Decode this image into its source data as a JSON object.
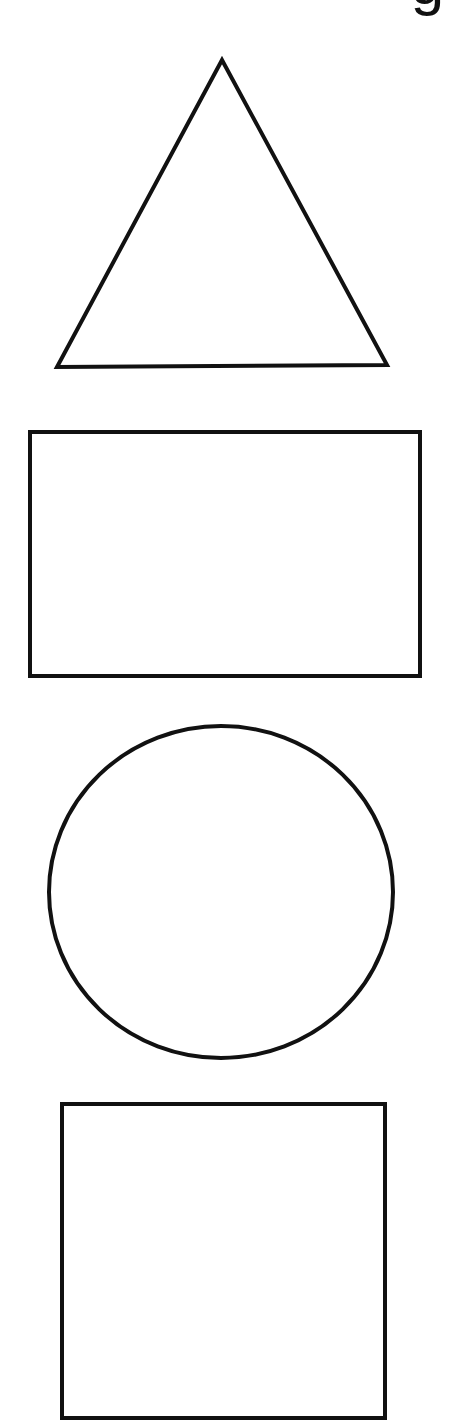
{
  "title": {
    "visible_fragment": "g"
  },
  "stroke": {
    "color": "#111111",
    "width": 4
  },
  "shapes": [
    {
      "name": "triangle",
      "points": "222,60 57,367 387,365"
    },
    {
      "name": "rectangle",
      "x": 30,
      "y": 432,
      "width": 390,
      "height": 244
    },
    {
      "name": "circle",
      "cx": 221,
      "cy": 892,
      "rx": 172,
      "ry": 166
    },
    {
      "name": "square",
      "x": 62,
      "y": 1104,
      "width": 323,
      "height": 314
    }
  ]
}
